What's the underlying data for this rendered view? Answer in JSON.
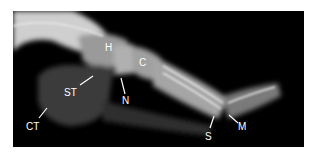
{
  "figure": {
    "labels": [
      {
        "id": "H",
        "text": "H"
      },
      {
        "id": "C",
        "text": "C"
      },
      {
        "id": "N",
        "text": "N"
      },
      {
        "id": "ST",
        "text": "ST"
      },
      {
        "id": "CT",
        "text": "CT"
      },
      {
        "id": "S",
        "text": "S"
      },
      {
        "id": "M",
        "text": "M"
      }
    ],
    "colors": {
      "background": "#000000",
      "bone": "#d9d9d9",
      "label": "#ffffff"
    }
  }
}
